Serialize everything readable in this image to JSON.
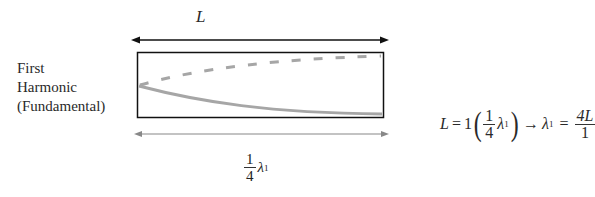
{
  "diagram": {
    "title_length_label": "L",
    "harmonic_label": [
      "First",
      "Harmonic",
      "(Fundamental)"
    ],
    "bottom_fraction": {
      "numerator": "1",
      "denominator": "4",
      "symbol": "λ",
      "subscript": "1"
    },
    "equation": {
      "lhs": "L",
      "equals": "=",
      "coef": "1",
      "frac_num": "1",
      "frac_den": "4",
      "lambda": "λ",
      "sub": "1",
      "arrow": "→",
      "rhs_lambda": "λ",
      "rhs_sub": "1",
      "rhs_equals": "=",
      "rhs_num": "4L",
      "rhs_den": "1"
    },
    "colors": {
      "line": "#111111",
      "wave": "#a6a6a6"
    }
  }
}
